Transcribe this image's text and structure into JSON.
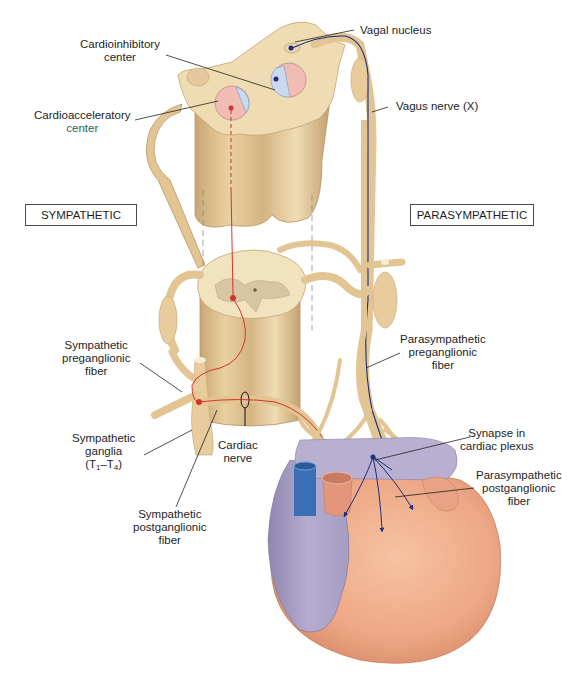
{
  "figure": {
    "colors": {
      "tissue": "#ecd3a3",
      "tissue_shadow": "#c9a774",
      "gray_matter": "#d8c6a3",
      "sympathetic_fiber": "#d2352c",
      "parasympathetic_fiber": "#1b2f7a",
      "heart_ventricle": "#eda784",
      "heart_atrium": "#a89ec0",
      "vena_cava": "#3a6fb5",
      "aorta": "#e4967a",
      "center_pink": "#f1bcb4",
      "center_blue": "#c9d9ee"
    }
  },
  "divisions": {
    "sympathetic": "SYMPATHETIC",
    "parasympathetic": "PARASYMPATHETIC"
  },
  "labels": {
    "cardioinhibitory": {
      "line1": "Cardioinhibitory",
      "line2": "center"
    },
    "cardioacceleratory": {
      "line1": "Cardioacceleratory",
      "line2": "center"
    },
    "vagal_nucleus": "Vagal nucleus",
    "vagus_nerve": "Vagus nerve (X)",
    "symp_preganglionic": {
      "line1": "Sympathetic",
      "line2": "preganglionic",
      "line3": "fiber"
    },
    "symp_ganglia": {
      "line1": "Sympathetic",
      "line2": "ganglia",
      "open": "(T",
      "sub1": "1",
      "dash": "–T",
      "sub2": "4",
      "close": ")"
    },
    "cardiac_nerve": {
      "line1": "Cardiac",
      "line2": "nerve"
    },
    "symp_postganglionic": {
      "line1": "Sympathetic",
      "line2": "postganglionic",
      "line3": "fiber"
    },
    "para_preganglionic": {
      "line1": "Parasympathetic",
      "line2": "preganglionic",
      "line3": "fiber"
    },
    "synapse_plexus": {
      "line1": "Synapse in",
      "line2": "cardiac plexus"
    },
    "para_postganglionic": {
      "line1": "Parasympathetic",
      "line2": "postganglionic",
      "line3": "fiber"
    }
  }
}
